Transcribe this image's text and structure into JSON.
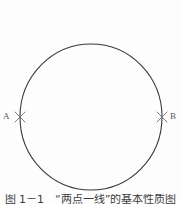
{
  "figure": {
    "caption": "图 1－1　“两点一线”的基本性质图",
    "background_color": "#fdfdfd",
    "stroke_color": "#3a393a",
    "label_color": "#555455"
  },
  "diagram": {
    "type": "circle-with-two-points",
    "circle": {
      "center_x": 91,
      "center_y": 117,
      "radius_x": 71,
      "radius_y": 73,
      "stroke_width": 1
    },
    "points": [
      {
        "id": "A",
        "label": "A",
        "marker": "x-marker",
        "x": 20,
        "y": 117
      },
      {
        "id": "B",
        "label": "B",
        "marker": "x-marker",
        "x": 162,
        "y": 117
      }
    ]
  }
}
